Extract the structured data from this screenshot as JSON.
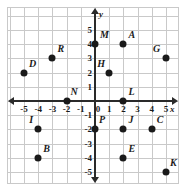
{
  "chart_data": {
    "type": "scatter",
    "title": "",
    "xlabel": "x",
    "ylabel": "y",
    "xlim": [
      -6,
      6
    ],
    "ylim": [
      -6,
      6
    ],
    "grid": true,
    "legend": "none",
    "x_ticks": [
      "-5",
      "-4",
      "-3",
      "-2",
      "-1",
      "0",
      "1",
      "2",
      "3",
      "4",
      "5"
    ],
    "x_tick_values": [
      -5,
      -4,
      -3,
      -2,
      -1,
      0,
      1,
      2,
      3,
      4,
      5
    ],
    "y_ticks": [
      "5",
      "4",
      "3",
      "2",
      "1",
      "-1",
      "-2",
      "-3",
      "-4",
      "-5"
    ],
    "y_tick_values": [
      5,
      4,
      3,
      2,
      1,
      -1,
      -2,
      -3,
      -4,
      -5
    ],
    "origin_label": "0",
    "points": [
      {
        "label": "M",
        "x": 0,
        "y": 4,
        "lx": 5,
        "ly": -14
      },
      {
        "label": "A",
        "x": 2,
        "y": 4,
        "lx": 5,
        "ly": -14
      },
      {
        "label": "G",
        "x": 5,
        "y": 3,
        "lx": -13,
        "ly": -14
      },
      {
        "label": "R",
        "x": -3,
        "y": 3,
        "lx": 5,
        "ly": -14
      },
      {
        "label": "D",
        "x": -5,
        "y": 2,
        "lx": 5,
        "ly": -14
      },
      {
        "label": "H",
        "x": 1,
        "y": 2,
        "lx": -12,
        "ly": -14
      },
      {
        "label": "N",
        "x": -2,
        "y": 0,
        "lx": 4,
        "ly": -14
      },
      {
        "label": "L",
        "x": 2,
        "y": 0,
        "lx": 5,
        "ly": -14
      },
      {
        "label": "I",
        "x": -4,
        "y": -2,
        "lx": -9,
        "ly": -14
      },
      {
        "label": "P",
        "x": 0,
        "y": -2,
        "lx": 4,
        "ly": -14
      },
      {
        "label": "J",
        "x": 2,
        "y": -2,
        "lx": 5,
        "ly": -14
      },
      {
        "label": "C",
        "x": 4,
        "y": -2,
        "lx": 5,
        "ly": -14
      },
      {
        "label": "B",
        "x": -4,
        "y": -4,
        "lx": 5,
        "ly": -14
      },
      {
        "label": "E",
        "x": 2,
        "y": -4,
        "lx": 5,
        "ly": -14
      },
      {
        "label": "K",
        "x": 5,
        "y": -5,
        "lx": 4,
        "ly": -14
      }
    ]
  },
  "style": {
    "point_color": "#1a1a1a",
    "axis_color": "#2a2a2a",
    "grid_color": "#c9c9c9",
    "background": "#ffffff"
  }
}
